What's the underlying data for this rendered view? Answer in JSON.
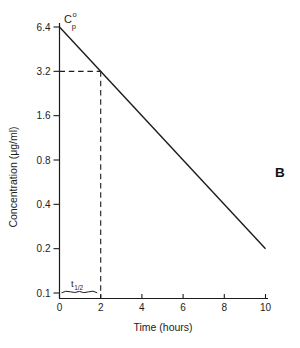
{
  "figure": {
    "panel_label": "B"
  },
  "chart_data": {
    "type": "line",
    "y_scale": "log",
    "title": "",
    "xlabel": "Time (hours)",
    "ylabel": "Concentration (μg/ml)",
    "xlim": [
      0,
      10
    ],
    "ylim": [
      0.1,
      6.4
    ],
    "grid": false,
    "legend": "none",
    "x_ticks": [
      0,
      2,
      4,
      6,
      8,
      10
    ],
    "x_tick_labels": [
      "0",
      "2",
      "4",
      "6",
      "8",
      "10"
    ],
    "y_ticks": [
      6.4,
      3.2,
      1.6,
      0.8,
      0.4,
      0.2,
      0.1
    ],
    "y_tick_labels": [
      "6.4",
      "3.2",
      "1.6",
      "0.8",
      "0.4",
      "0.2",
      "0.1"
    ],
    "series": [
      {
        "name": "plasma concentration decline",
        "x": [
          0,
          10
        ],
        "y": [
          6.4,
          0.2
        ]
      }
    ],
    "annotations": {
      "initial_concentration": {
        "base": "C",
        "sup": "o",
        "sub": "p",
        "at_x": 0,
        "at_y": 6.4
      },
      "half_life": {
        "base": "t",
        "sub": "1/2",
        "span_x": [
          0,
          2
        ]
      },
      "guide_lines": {
        "x": 2,
        "y": 3.2,
        "style": "dashed"
      }
    }
  }
}
